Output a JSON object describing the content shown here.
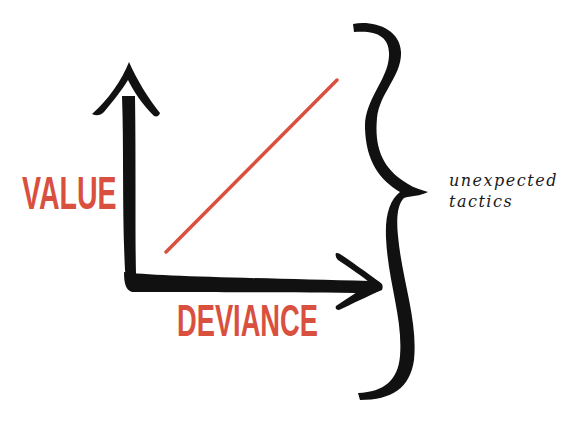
{
  "diagram": {
    "y_axis_label": "VALUE",
    "x_axis_label": "DEVIANCE",
    "annotation": {
      "line1": "unexpected",
      "line2": "tactics"
    },
    "colors": {
      "accent_red": "#d9503f",
      "ink_black": "#111111",
      "background": "#ffffff"
    },
    "elements": {
      "y_axis": "up-arrow-icon",
      "x_axis": "right-arrow-icon",
      "trend_line": "diagonal-red-line",
      "brace": "right-curly-brace-icon"
    }
  }
}
